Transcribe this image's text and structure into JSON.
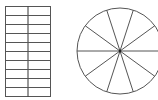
{
  "figure": {
    "background": "#ffffff",
    "stroke_color": "#555555",
    "grid": {
      "rows": 10,
      "columns": 2,
      "x": 5,
      "y": 6,
      "width": 45,
      "height": 90
    },
    "circle": {
      "cx": 120,
      "cy": 51,
      "r": 43,
      "sectors": 10,
      "start_angle_deg": 0,
      "center_dot": true
    }
  }
}
